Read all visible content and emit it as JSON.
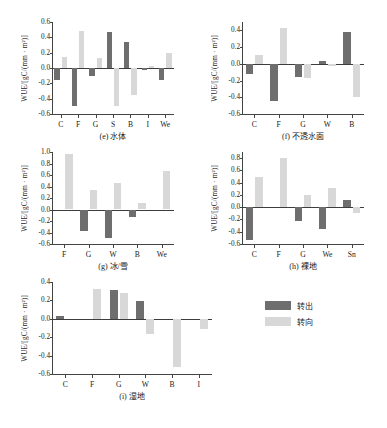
{
  "figure": {
    "ylabel": "WUE/[gC/(mm · m²)]",
    "legend": {
      "position": "bottom-right",
      "entries": [
        {
          "label": "转出",
          "color": "#6e6e6e",
          "key": "out"
        },
        {
          "label": "转向",
          "color": "#d8d8d8",
          "key": "in"
        }
      ]
    }
  },
  "chart_data": [
    {
      "type": "bar",
      "panel": "e",
      "title": "(e) 水体",
      "ylabel": "WUE/[gC/(mm · m²)]",
      "xlabel": "",
      "ylim": [
        -0.6,
        0.6
      ],
      "yticks": [
        -0.6,
        -0.4,
        -0.2,
        0.0,
        0.2,
        0.4,
        0.6
      ],
      "ytick_labels": [
        "-0.6",
        "-0.4",
        "-0.2",
        "0.0",
        "0.2",
        "0.4",
        "0.6"
      ],
      "grid": false,
      "categories": [
        "C",
        "F",
        "G",
        "S",
        "B",
        "I",
        "We"
      ],
      "series": [
        {
          "name": "转出",
          "color": "#6e6e6e",
          "values": [
            -0.16,
            -0.5,
            -0.11,
            0.47,
            0.34,
            -0.03,
            -0.15
          ]
        },
        {
          "name": "转向",
          "color": "#d8d8d8",
          "values": [
            0.14,
            0.48,
            0.13,
            -0.5,
            -0.35,
            0.02,
            0.19
          ]
        }
      ]
    },
    {
      "type": "bar",
      "panel": "f",
      "title": "(f) 不透水面",
      "ylabel": "WUE/[gC/(mm · m²)]",
      "xlabel": "",
      "ylim": [
        -0.6,
        0.5
      ],
      "yticks": [
        -0.6,
        -0.4,
        -0.2,
        0.0,
        0.2,
        0.4
      ],
      "ytick_labels": [
        "-0.6",
        "-0.4",
        "-0.2",
        "0.0",
        "0.2",
        "0.4"
      ],
      "grid": false,
      "categories": [
        "C",
        "F",
        "G",
        "W",
        "B"
      ],
      "series": [
        {
          "name": "转出",
          "color": "#6e6e6e",
          "values": [
            -0.12,
            -0.44,
            -0.16,
            0.03,
            0.38
          ]
        },
        {
          "name": "转向",
          "color": "#d8d8d8",
          "values": [
            0.11,
            0.43,
            -0.17,
            -0.03,
            -0.4
          ]
        }
      ]
    },
    {
      "type": "bar",
      "panel": "g",
      "title": "(g) 冰/雪",
      "ylabel": "WUE/[gC/(mm · m²)]",
      "xlabel": "",
      "ylim": [
        -0.6,
        1.0
      ],
      "yticks": [
        -0.6,
        -0.4,
        -0.2,
        0.0,
        0.2,
        0.4,
        0.6,
        0.8,
        1.0
      ],
      "ytick_labels": [
        "-0.6",
        "-0.4",
        "-0.2",
        "0.0",
        "0.2",
        "0.4",
        "0.6",
        "0.8",
        "1.0"
      ],
      "grid": false,
      "categories": [
        "F",
        "G",
        "W",
        "B",
        "We"
      ],
      "series": [
        {
          "name": "转出",
          "color": "#6e6e6e",
          "values": [
            0.0,
            -0.37,
            -0.49,
            -0.13,
            0.0
          ]
        },
        {
          "name": "转向",
          "color": "#d8d8d8",
          "values": [
            0.96,
            0.34,
            0.46,
            0.11,
            0.67
          ]
        }
      ]
    },
    {
      "type": "bar",
      "panel": "h",
      "title": "(h) 裸地",
      "ylabel": "WUE/[gC/(mm · m²)]",
      "xlabel": "",
      "ylim": [
        -0.6,
        0.9
      ],
      "yticks": [
        -0.6,
        -0.4,
        -0.2,
        0.0,
        0.2,
        0.4,
        0.6,
        0.8
      ],
      "ytick_labels": [
        "-0.6",
        "-0.4",
        "-0.2",
        "0.0",
        "0.2",
        "0.4",
        "0.6",
        "0.8"
      ],
      "grid": false,
      "categories": [
        "C",
        "F",
        "G",
        "We",
        "Sn"
      ],
      "series": [
        {
          "name": "转出",
          "color": "#6e6e6e",
          "values": [
            -0.54,
            0.0,
            -0.23,
            -0.36,
            0.12
          ]
        },
        {
          "name": "转向",
          "color": "#d8d8d8",
          "values": [
            0.49,
            0.81,
            0.2,
            0.32,
            -0.09
          ]
        }
      ]
    },
    {
      "type": "bar",
      "panel": "i",
      "title": "(i) 湿地",
      "ylabel": "WUE/[gC/(mm · m²)]",
      "xlabel": "",
      "ylim": [
        -0.6,
        0.4
      ],
      "yticks": [
        -0.6,
        -0.4,
        -0.2,
        0.0,
        0.2,
        0.4
      ],
      "ytick_labels": [
        "-0.6",
        "-0.4",
        "-0.2",
        "0.0",
        "0.2",
        "0.4"
      ],
      "grid": false,
      "categories": [
        "C",
        "F",
        "G",
        "W",
        "B",
        "I"
      ],
      "series": [
        {
          "name": "转出",
          "color": "#6e6e6e",
          "values": [
            0.03,
            0.0,
            0.31,
            0.19,
            0.0,
            0.0
          ]
        },
        {
          "name": "转向",
          "color": "#d8d8d8",
          "values": [
            0.0,
            0.32,
            0.28,
            -0.16,
            -0.52,
            -0.11
          ]
        }
      ]
    }
  ]
}
